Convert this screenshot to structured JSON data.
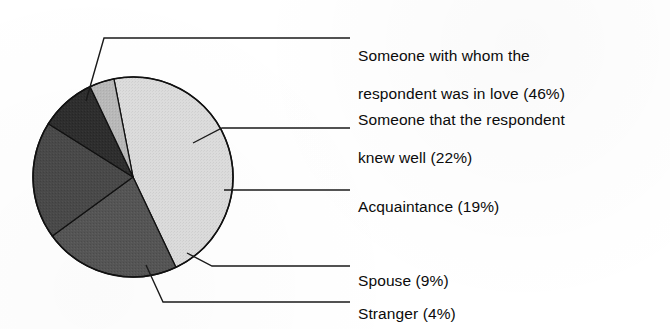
{
  "chart_data": {
    "type": "pie",
    "title": "",
    "subtitle": "",
    "xlabel": "",
    "ylabel": "",
    "legend_position": "right-callout-labels",
    "grid": false,
    "total_percent": 100,
    "categories": [
      "Someone with whom the respondent was in love",
      "Someone that the respondent knew well",
      "Acquaintance",
      "Spouse",
      "Stranger"
    ],
    "values": [
      46,
      22,
      19,
      9,
      4
    ],
    "unit": "%",
    "slices": [
      {
        "name": "love",
        "label_line1": "Someone with whom the",
        "label_line2": "respondent was in love (46%)",
        "label_full": "Someone with whom the respondent was in love (46%)",
        "value": 46,
        "value_text": "46%",
        "color": "#dcdcdc"
      },
      {
        "name": "knew-well",
        "label_line1": "Someone that the respondent",
        "label_line2": "knew well (22%)",
        "label_full": "Someone that the respondent knew well (22%)",
        "value": 22,
        "value_text": "22%",
        "color": "#565656"
      },
      {
        "name": "acquaintance",
        "label_line1": "Acquaintance (19%)",
        "label_line2": "",
        "label_full": "Acquaintance (19%)",
        "value": 19,
        "value_text": "19%",
        "color": "#4a4a4a"
      },
      {
        "name": "spouse",
        "label_line1": "Spouse (9%)",
        "label_line2": "",
        "label_full": "Spouse (9%)",
        "value": 9,
        "value_text": "9%",
        "color": "#2e2e2e"
      },
      {
        "name": "stranger",
        "label_line1": "Stranger (4%)",
        "label_line2": "",
        "label_full": "Stranger (4%)",
        "value": 4,
        "value_text": "4%",
        "color": "#b8b8b8"
      }
    ],
    "geometry": {
      "center_x": 133,
      "center_y": 177,
      "radius": 100,
      "start_angle_deg": -101,
      "direction": "clockwise"
    },
    "style": {
      "background": "#ffffff",
      "outline_color": "#111111",
      "leader_line_color": "#1a1a1a",
      "text_color": "#0b0b0b"
    }
  }
}
